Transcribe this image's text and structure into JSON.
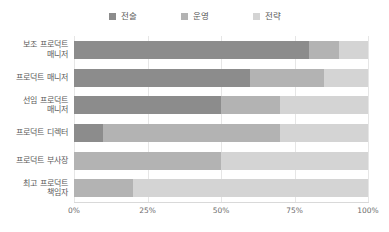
{
  "chart_data": {
    "type": "bar",
    "orientation": "horizontal",
    "stacked": true,
    "normalized": "100%",
    "title": "",
    "subtitle": "",
    "xlabel": "",
    "ylabel": "",
    "xlim": [
      0,
      100
    ],
    "grid": true,
    "legend_position": "top-center",
    "xtick_labels": [
      "0%",
      "25%",
      "50%",
      "75%",
      "100%"
    ],
    "xtick_values": [
      0,
      25,
      50,
      75,
      100
    ],
    "categories": [
      "보조 프로덕트\n매니저",
      "프로덕트 매니저",
      "선임 프로덕트\n매니저",
      "프로덕트 디렉터",
      "프로덕트 부사장",
      "최고 프로덕트\n책임자"
    ],
    "series": [
      {
        "name": "전술",
        "color": "#8c8c8c",
        "values": [
          80,
          60,
          50,
          10,
          0,
          0
        ]
      },
      {
        "name": "운영",
        "color": "#b3b3b3",
        "values": [
          10,
          25,
          20,
          60,
          50,
          20
        ]
      },
      {
        "name": "전략",
        "color": "#d4d4d4",
        "values": [
          10,
          15,
          30,
          30,
          50,
          80
        ]
      }
    ]
  },
  "legend": {
    "items": [
      {
        "label": "전술",
        "color": "#8c8c8c"
      },
      {
        "label": "운영",
        "color": "#b3b3b3"
      },
      {
        "label": "전략",
        "color": "#d4d4d4"
      }
    ]
  },
  "axis": {
    "ticks": [
      "0%",
      "25%",
      "50%",
      "75%",
      "100%"
    ]
  }
}
